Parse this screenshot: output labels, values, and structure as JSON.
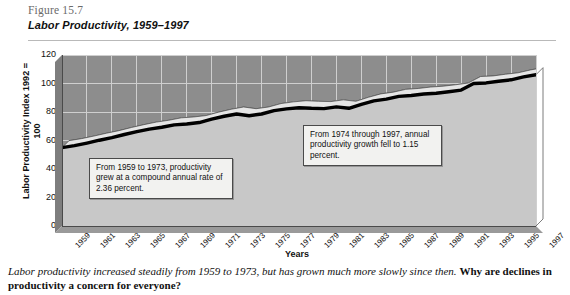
{
  "figure": {
    "number": "Figure 15.7",
    "title": "Labor Productivity, 1959–1997"
  },
  "caption": {
    "lead": "Labor productivity increased steadily from 1959 to 1973, but has grown much more slowly since then.",
    "question": "Why are declines in productivity a concern for everyone?"
  },
  "annotations": [
    {
      "id": "callout-1",
      "text": "From 1959 to 1973, productivity grew at a compound annual rate of 2.36 percent."
    },
    {
      "id": "callout-2",
      "text": "From 1974 through 1997, annual productivity growth fell to 1.15 percent."
    }
  ],
  "colors": {
    "plot_background": "#8d8d8d",
    "gridline": "#cfcfcf",
    "area_fill": "#cccccc",
    "area_top": "#e8e8e8",
    "curve": "#000000",
    "callout_background": "#f2f2f0",
    "callout_border": "#4a4a4a",
    "header_rule": "#b9b9b9"
  },
  "chart_data": {
    "type": "area",
    "title": "Labor Productivity, 1959–1997",
    "xlabel": "Years",
    "ylabel": "Labor Productivity Index 1992 = 100",
    "ylim": [
      0,
      120
    ],
    "yticks": [
      0,
      20,
      40,
      60,
      80,
      100,
      120
    ],
    "xlim": [
      1959,
      1997
    ],
    "grid": true,
    "legend": null,
    "xticklabels": [
      "1959",
      "1961",
      "1963",
      "1965",
      "1967",
      "1969",
      "1971",
      "1973",
      "1975",
      "1977",
      "1979",
      "1981",
      "1983",
      "1985",
      "1987",
      "1989",
      "1991",
      "1993",
      "1995",
      "1997"
    ],
    "x": [
      1959,
      1960,
      1961,
      1962,
      1963,
      1964,
      1965,
      1966,
      1967,
      1968,
      1969,
      1970,
      1971,
      1972,
      1973,
      1974,
      1975,
      1976,
      1977,
      1978,
      1979,
      1980,
      1981,
      1982,
      1983,
      1984,
      1985,
      1986,
      1987,
      1988,
      1989,
      1990,
      1991,
      1992,
      1993,
      1994,
      1995,
      1996,
      1997
    ],
    "values": [
      55.0,
      56.4,
      58.2,
      60.2,
      62.0,
      64.2,
      66.2,
      68.0,
      69.3,
      71.0,
      71.6,
      72.6,
      75.0,
      77.0,
      78.6,
      77.4,
      78.6,
      81.0,
      82.2,
      83.0,
      82.6,
      82.4,
      83.6,
      82.6,
      85.4,
      87.8,
      89.0,
      91.0,
      91.6,
      92.6,
      93.2,
      94.2,
      95.4,
      100.0,
      100.4,
      101.6,
      102.6,
      104.6,
      106.2
    ],
    "annotations": [
      {
        "text": "From 1959 to 1973, productivity grew at a compound annual rate of 2.36 percent.",
        "period": [
          1959,
          1973
        ],
        "rate_percent": 2.36
      },
      {
        "text": "From 1974 through 1997, annual productivity growth fell to 1.15 percent.",
        "period": [
          1974,
          1997
        ],
        "rate_percent": 1.15
      }
    ]
  }
}
